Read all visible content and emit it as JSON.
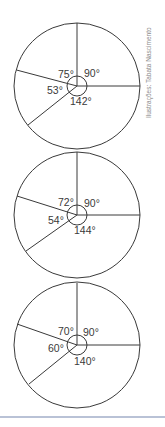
{
  "credit": "Ilustrações: Tabata Nascimento",
  "colors": {
    "stroke": "#3a3a3a",
    "label": "#3a3a3a",
    "credit": "#8a8a8a",
    "rule": "#b9c2d6"
  },
  "diagrams": [
    {
      "angles": {
        "top_left": "75°",
        "top_right": "90°",
        "left": "53°",
        "bottom": "142°"
      }
    },
    {
      "angles": {
        "top_left": "72°",
        "top_right": "90°",
        "left": "54°",
        "bottom": "144°"
      }
    },
    {
      "angles": {
        "top_left": "70°",
        "top_right": "90°",
        "left": "60°",
        "bottom": "140°"
      }
    }
  ]
}
